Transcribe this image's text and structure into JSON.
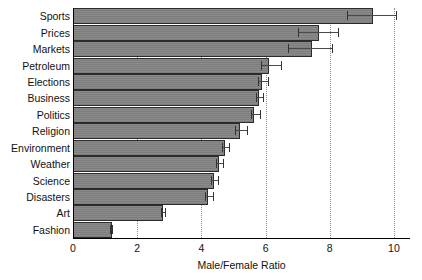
{
  "chart_data": {
    "type": "bar",
    "orientation": "horizontal",
    "title": "",
    "xlabel": "Male/Female Ratio",
    "ylabel": "",
    "xlim": [
      0,
      10.5
    ],
    "xticks": [
      0,
      2,
      4,
      6,
      8,
      10
    ],
    "xtick_labels": [
      "0",
      "2",
      "4",
      "6",
      "8",
      "10"
    ],
    "grid": "vertical-dotted",
    "legend": null,
    "bar_color": "#7d7d7d",
    "bar_edge_color": "#2b2b2b",
    "error_bar_color": "#4a4a4a",
    "categories": [
      "Sports",
      "Prices",
      "Markets",
      "Petroleum",
      "Elections",
      "Business",
      "Politics",
      "Religion",
      "Environment",
      "Weather",
      "Science",
      "Disasters",
      "Art",
      "Fashion"
    ],
    "values": [
      9.35,
      7.65,
      7.45,
      6.1,
      5.9,
      5.8,
      5.65,
      5.2,
      4.75,
      4.55,
      4.4,
      4.2,
      2.8,
      1.2
    ],
    "error_low": [
      8.55,
      7.0,
      6.7,
      5.85,
      5.75,
      5.7,
      5.55,
      5.05,
      4.65,
      4.45,
      4.3,
      4.1,
      2.75,
      1.15
    ],
    "error_high": [
      10.1,
      8.3,
      8.1,
      6.5,
      6.1,
      5.95,
      5.85,
      5.45,
      4.9,
      4.7,
      4.55,
      4.4,
      2.9,
      1.25
    ]
  }
}
